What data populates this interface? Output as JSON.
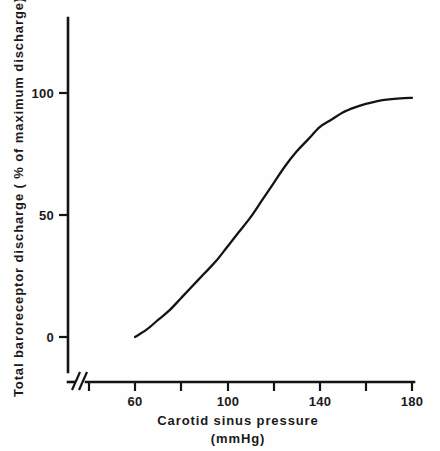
{
  "chart_data": {
    "type": "line",
    "title": "",
    "xlabel": "Carotid sinus pressure",
    "xlabel_units": "(mmHg)",
    "ylabel": "Total baroreceptor discharge ( % of maximum discharge)",
    "xlim": [
      40,
      180
    ],
    "ylim": [
      -12,
      112
    ],
    "xticks": [
      60,
      80,
      100,
      120,
      140,
      160,
      180
    ],
    "xtick_labels": [
      "60",
      "",
      "100",
      "",
      "140",
      "",
      "180"
    ],
    "yticks": [
      0,
      50,
      100
    ],
    "ytick_labels": [
      "0",
      "50",
      "100"
    ],
    "grid": false,
    "legend": null,
    "axis_break": "x-axis broken between origin and first tick",
    "x": [
      60,
      65,
      70,
      75,
      80,
      85,
      90,
      95,
      100,
      105,
      110,
      115,
      120,
      125,
      130,
      135,
      140,
      145,
      150,
      155,
      160,
      165,
      170,
      175,
      180
    ],
    "y": [
      0,
      3,
      7,
      11,
      16,
      21,
      26,
      31,
      37,
      43,
      49,
      56,
      63,
      70,
      76,
      81,
      86,
      89,
      92,
      94,
      95.5,
      96.7,
      97.4,
      97.8,
      98
    ],
    "series": [
      {
        "name": "Total baroreceptor discharge",
        "values": [
          0,
          3,
          7,
          11,
          16,
          21,
          26,
          31,
          37,
          43,
          49,
          56,
          63,
          70,
          76,
          81,
          86,
          89,
          92,
          94,
          95.5,
          96.7,
          97.4,
          97.8,
          98
        ]
      }
    ]
  },
  "axis": {
    "y_tick_0": "0",
    "y_tick_50": "50",
    "y_tick_100": "100",
    "x_tick_60": "60",
    "x_tick_100": "100",
    "x_tick_140": "140",
    "x_tick_180": "180",
    "x_title_line1": "Carotid sinus pressure",
    "x_title_line2": "(mmHg)",
    "y_title": "Total baroreceptor discharge ( % of maximum discharge)"
  },
  "colors": {
    "ink": "#141414",
    "background": "#fefefe"
  }
}
